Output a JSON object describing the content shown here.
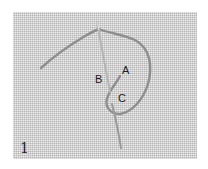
{
  "image": {
    "description": "Grayscale photo of an embroidery stitch step on linen fabric: a threaded needle with a looped thread",
    "figure_number": "1",
    "labels": [
      {
        "id": "A",
        "text": "A"
      },
      {
        "id": "B",
        "text": "B"
      },
      {
        "id": "C",
        "text": "C"
      }
    ],
    "colors": {
      "fabric": "#cfcfcf",
      "thread": "#8a8a8a",
      "needle": "#b8b8b8",
      "label": "#1a1a1a"
    }
  }
}
